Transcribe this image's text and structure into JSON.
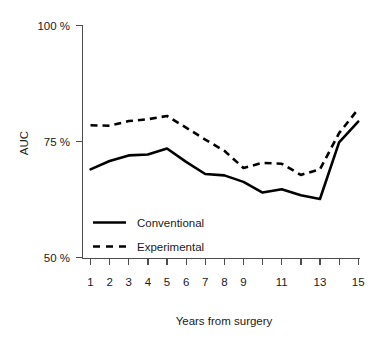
{
  "chart_data": {
    "type": "line",
    "title": "",
    "subtitle": "",
    "xlabel": "Years from surgery",
    "ylabel": "AUC",
    "xlim": [
      1,
      15
    ],
    "ylim": [
      50,
      100
    ],
    "grid": false,
    "legend_position": "inside-lower-left",
    "x": [
      1,
      2,
      3,
      4,
      5,
      6,
      7,
      8,
      9,
      10,
      11,
      12,
      13,
      14,
      15
    ],
    "x_tick_labels": [
      "1",
      "2",
      "3",
      "4",
      "5",
      "6",
      "7",
      "8",
      "9",
      "",
      "11",
      "",
      "13",
      "",
      "15"
    ],
    "y_tick_values": [
      50,
      75,
      100
    ],
    "y_tick_labels": [
      "50 %",
      "75 %",
      "100 %"
    ],
    "series": [
      {
        "name": "Conventional",
        "style": "solid",
        "color": "#000000",
        "values": [
          69.0,
          70.8,
          72.0,
          72.2,
          73.5,
          70.6,
          68.0,
          67.7,
          66.3,
          64.0,
          64.7,
          63.4,
          62.6,
          74.8,
          79.3
        ]
      },
      {
        "name": "Experimental",
        "style": "dashed",
        "color": "#000000",
        "values": [
          78.5,
          78.4,
          79.4,
          79.8,
          80.5,
          78.0,
          75.4,
          73.0,
          69.3,
          70.4,
          70.2,
          67.8,
          69.0,
          76.8,
          82.0
        ]
      }
    ],
    "annotations": {
      "sharp_rise_between_years": [
        13,
        14
      ],
      "conventional_minimum": {
        "x": 13,
        "y": 62.6
      },
      "experimental_maximum": {
        "x": 15,
        "y": 82.0
      }
    }
  },
  "legend": {
    "entries": [
      {
        "label": "Conventional",
        "style": "solid"
      },
      {
        "label": "Experimental",
        "style": "dashed"
      }
    ]
  },
  "axes": {
    "y_label": "AUC",
    "x_label": "Years from surgery",
    "y_ticks": [
      "100 %",
      "75 %",
      "50 %"
    ],
    "x_ticks": [
      "1",
      "2",
      "3",
      "4",
      "5",
      "6",
      "7",
      "8",
      "9",
      "11",
      "13",
      "15"
    ]
  },
  "colors": {
    "line": "#000000",
    "axis": "#4d4d4d",
    "text": "#1a1a1a",
    "background": "#ffffff"
  }
}
